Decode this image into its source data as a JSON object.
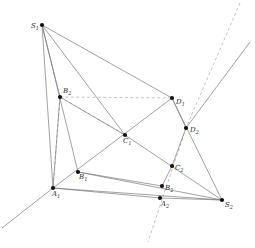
{
  "figure": {
    "type": "geometric-diagram",
    "width": 255,
    "height": 248,
    "background_color": "#ffffff",
    "solid_line_color": "#7a7a7a",
    "dashed_line_color": "#a8a8a8",
    "vertex_color": "#111111"
  },
  "points": [
    {
      "id": "S1",
      "label": "S",
      "sub": "1",
      "x": 42,
      "y": 25,
      "label_dx": -11,
      "label_dy": -2
    },
    {
      "id": "B2",
      "label": "B",
      "sub": "2",
      "x": 60,
      "y": 97,
      "label_dx": 3,
      "label_dy": -9
    },
    {
      "id": "D1",
      "label": "D",
      "sub": "1",
      "x": 172,
      "y": 98,
      "label_dx": 4,
      "label_dy": 1
    },
    {
      "id": "D2",
      "label": "D",
      "sub": "2",
      "x": 186,
      "y": 128,
      "label_dx": 4,
      "label_dy": -1
    },
    {
      "id": "C1",
      "label": "C",
      "sub": "1",
      "x": 125,
      "y": 135,
      "label_dx": -2,
      "label_dy": 3
    },
    {
      "id": "C2",
      "label": "C",
      "sub": "2",
      "x": 172,
      "y": 166,
      "label_dx": 3,
      "label_dy": -1
    },
    {
      "id": "B1",
      "label": "B",
      "sub": "1",
      "x": 78,
      "y": 172,
      "label_dx": 1,
      "label_dy": 2
    },
    {
      "id": "B3",
      "label": "B",
      "sub": "2",
      "x": 162,
      "y": 186,
      "label_dx": 3,
      "label_dy": -1
    },
    {
      "id": "A1",
      "label": "A",
      "sub": "1",
      "x": 53,
      "y": 188,
      "label_dx": -1,
      "label_dy": 3
    },
    {
      "id": "A2",
      "label": "A",
      "sub": "2",
      "x": 160,
      "y": 198,
      "label_dx": 1,
      "label_dy": 3
    },
    {
      "id": "S2",
      "label": "S",
      "sub": "2",
      "x": 222,
      "y": 200,
      "label_dx": 3,
      "label_dy": 2
    }
  ],
  "solid_edges": [
    {
      "name": "S1-A1",
      "from": "S1",
      "to": "A1"
    },
    {
      "name": "S1-B1",
      "from": "S1",
      "to": "B1"
    },
    {
      "name": "S1-C1",
      "from": "S1",
      "to": "C1"
    },
    {
      "name": "S1-D1",
      "from": "S1",
      "to": "D1"
    },
    {
      "name": "S1-B2",
      "from": "S1",
      "to": "B2"
    },
    {
      "name": "S2-A1",
      "from": "S2",
      "to": "A1"
    },
    {
      "name": "S2-B1",
      "from": "S2",
      "to": "B1"
    },
    {
      "name": "S2-C1",
      "from": "S2",
      "to": "C1"
    },
    {
      "name": "S2-D1",
      "from": "S2",
      "to": "D1"
    },
    {
      "name": "S2-A2",
      "from": "S2",
      "to": "A2"
    },
    {
      "name": "A1-B2",
      "from": "A1",
      "to": "B2"
    },
    {
      "name": "B2-C1",
      "from": "B2",
      "to": "C1"
    },
    {
      "name": "A1-D1",
      "from": "A1",
      "to": "D1"
    },
    {
      "name": "D1-D2",
      "from": "D1",
      "to": "D2"
    },
    {
      "name": "D2-C2",
      "from": "D2",
      "to": "C2"
    },
    {
      "name": "C2-B3",
      "from": "C2",
      "to": "B3"
    },
    {
      "name": "A1-A2",
      "from": "A1",
      "to": "A2"
    },
    {
      "name": "B1-B3",
      "from": "B1",
      "to": "B3"
    }
  ],
  "dashed_edges": [
    {
      "name": "B2-D1-dashed",
      "from": "B2",
      "to": "D1"
    },
    {
      "name": "B2-C1-dashed",
      "from": "B2",
      "to": "C1"
    },
    {
      "name": "B2-A1-dashed",
      "from": "B2",
      "to": "A1"
    }
  ],
  "rays": [
    {
      "name": "axis-solid-lower-left",
      "kind": "solid",
      "x1": 2,
      "y1": 228,
      "x2": 53,
      "y2": 188
    },
    {
      "name": "axis-solid-upper-right",
      "kind": "solid",
      "x1": 186,
      "y1": 128,
      "x2": 250,
      "y2": 42
    },
    {
      "name": "axis-dashed-upper",
      "kind": "dashed",
      "x1": 240,
      "y1": 3,
      "x2": 186,
      "y2": 128
    },
    {
      "name": "axis-dashed-lower",
      "kind": "dashed",
      "x1": 186,
      "y1": 128,
      "x2": 148,
      "y2": 242
    }
  ]
}
